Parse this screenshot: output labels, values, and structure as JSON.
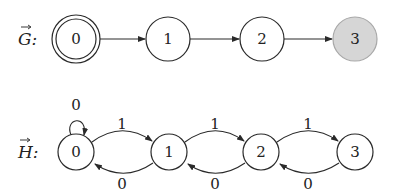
{
  "graphs": [
    {
      "name": "G",
      "label": "G:",
      "arrow_over": true,
      "nodes": [
        {
          "id": "0",
          "label": "0",
          "cx": 76,
          "cy": 39,
          "double": true,
          "filled": false
        },
        {
          "id": "1",
          "label": "1",
          "cx": 168,
          "cy": 39,
          "double": false,
          "filled": false
        },
        {
          "id": "2",
          "label": "2",
          "cx": 262,
          "cy": 39,
          "double": false,
          "filled": false
        },
        {
          "id": "3",
          "label": "3",
          "cx": 355,
          "cy": 39,
          "double": false,
          "filled": true
        }
      ],
      "edges": [
        {
          "from": "0",
          "to": "1",
          "label": ""
        },
        {
          "from": "1",
          "to": "2",
          "label": ""
        },
        {
          "from": "2",
          "to": "3",
          "label": ""
        }
      ]
    },
    {
      "name": "H",
      "label": "H:",
      "arrow_over": true,
      "nodes": [
        {
          "id": "0",
          "label": "0",
          "cx": 76,
          "cy": 152
        },
        {
          "id": "1",
          "label": "1",
          "cx": 169,
          "cy": 152
        },
        {
          "id": "2",
          "label": "2",
          "cx": 261,
          "cy": 152
        },
        {
          "id": "3",
          "label": "3",
          "cx": 355,
          "cy": 152
        }
      ],
      "edges": [
        {
          "from": "0",
          "to": "0",
          "label": "0",
          "type": "self-loop"
        },
        {
          "from": "0",
          "to": "1",
          "label": "1"
        },
        {
          "from": "1",
          "to": "0",
          "label": "0"
        },
        {
          "from": "1",
          "to": "2",
          "label": "1"
        },
        {
          "from": "2",
          "to": "1",
          "label": "0"
        },
        {
          "from": "2",
          "to": "3",
          "label": "1"
        },
        {
          "from": "3",
          "to": "2",
          "label": "0"
        }
      ]
    }
  ],
  "colors": {
    "stroke": "#2a2a2a",
    "accept_fill": "#d6d6d6",
    "accept_stroke": "#a8a8a8"
  }
}
